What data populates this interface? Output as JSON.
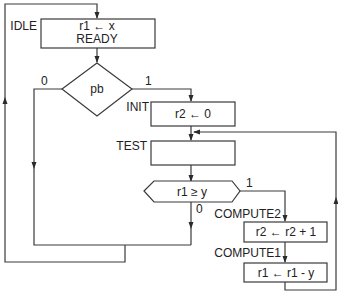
{
  "diagram": {
    "type": "ASM chart (algorithmic state machine) for division by repeated subtraction",
    "states": [
      {
        "name": "IDLE",
        "actions": [
          "r1 ← x",
          "READY"
        ]
      },
      {
        "name": "INIT",
        "actions": [
          "r2 ← 0"
        ]
      },
      {
        "name": "TEST",
        "actions": []
      },
      {
        "name": "COMPUTE2",
        "actions": [
          "r2 ← r2 + 1"
        ]
      },
      {
        "name": "COMPUTE1",
        "actions": [
          "r1 ← r1 - y"
        ]
      }
    ],
    "decisions": [
      {
        "condition": "pb",
        "true_label": "1",
        "false_label": "0"
      },
      {
        "condition": "r1 ≥ y",
        "true_label": "1",
        "false_label": "0"
      }
    ],
    "transitions": [
      "IDLE → pb?",
      "pb = 0 → IDLE",
      "pb = 1 → INIT",
      "INIT → TEST",
      "TEST → r1 ≥ y?",
      "r1 ≥ y = 1 → COMPUTE2",
      "r1 ≥ y = 0 → IDLE",
      "COMPUTE2 → COMPUTE1",
      "COMPUTE1 → TEST"
    ]
  },
  "labels": {
    "idle": "IDLE",
    "idle_action1": "r1 ← x",
    "idle_action2": "READY",
    "pb": "pb",
    "pb_zero": "0",
    "pb_one": "1",
    "init": "INIT",
    "init_action": "r2 ← 0",
    "test": "TEST",
    "cond": "r1 ≥ y",
    "cond_one": "1",
    "cond_zero": "0",
    "compute2": "COMPUTE2",
    "compute2_action": "r2 ← r2 + 1",
    "compute1": "COMPUTE1",
    "compute1_action": "r1 ← r1 - y"
  }
}
